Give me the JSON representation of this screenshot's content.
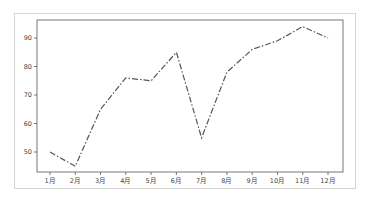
{
  "chart_data": {
    "type": "line",
    "title": "",
    "xlabel": "",
    "ylabel": "",
    "categories": [
      "1月",
      "2月",
      "3月",
      "4月",
      "5月",
      "6月",
      "7月",
      "8月",
      "9月",
      "10月",
      "11月",
      "12月"
    ],
    "series": [
      {
        "name": "",
        "values": [
          50,
          45,
          65,
          76,
          75,
          85,
          55,
          78,
          86,
          89,
          94,
          90
        ],
        "color": "#555555",
        "line_style": "dash-dot"
      }
    ],
    "yticks": [
      50,
      60,
      70,
      80,
      90
    ],
    "ytick_labels": [
      "50",
      "60",
      "70",
      "80",
      "90"
    ],
    "ylim": [
      42,
      96
    ],
    "grid": false,
    "legend": false
  }
}
